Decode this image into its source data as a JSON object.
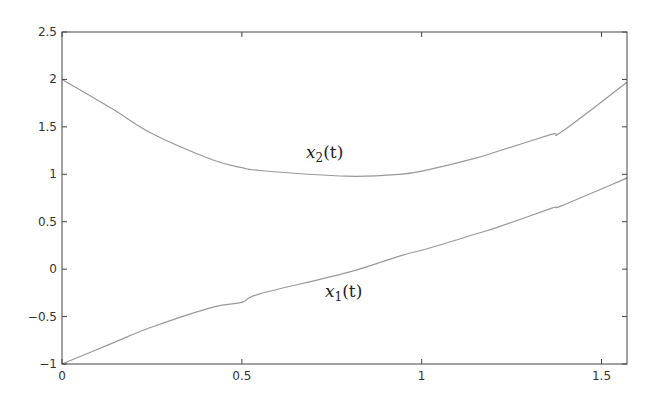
{
  "chart_data": {
    "type": "line",
    "title": "",
    "xlabel": "",
    "ylabel": "",
    "xlim": [
      0,
      1.5708
    ],
    "ylim": [
      -1,
      2.5
    ],
    "grid": false,
    "legend": "none (inline curve labels)",
    "x_ticks": [
      "0",
      "0.5",
      "1",
      "1.5"
    ],
    "y_ticks": [
      "-1",
      "-0.5",
      "0",
      "0.5",
      "1",
      "1.5",
      "2",
      "2.5"
    ],
    "x": [
      0,
      0.14,
      0.25,
      0.42,
      0.5,
      0.55,
      0.79,
      0.94,
      1.02,
      1.15,
      1.21,
      1.36,
      1.39,
      1.5708
    ],
    "series": [
      {
        "name": "x1(t)",
        "values": [
          -1.0,
          -0.78,
          -0.61,
          -0.4,
          -0.35,
          -0.26,
          -0.04,
          0.14,
          0.22,
          0.37,
          0.44,
          0.64,
          0.67,
          0.96
        ]
      },
      {
        "name": "x2(t)",
        "values": [
          2.0,
          1.69,
          1.43,
          1.15,
          1.07,
          1.04,
          0.98,
          1.0,
          1.05,
          1.17,
          1.24,
          1.42,
          1.45,
          1.97
        ]
      }
    ],
    "annotations": [
      {
        "text": "x2(t)",
        "x": 0.75,
        "y": 1.2
      },
      {
        "text": "x1(t)",
        "x": 0.8,
        "y": -0.25
      }
    ]
  },
  "labels": {
    "x1_main": "x",
    "x1_sub": "1",
    "x1_arg": "(t)",
    "x2_main": "x",
    "x2_sub": "2",
    "x2_arg": "(t)"
  },
  "colors": {
    "axis": "#444444",
    "curve": "#999999"
  }
}
